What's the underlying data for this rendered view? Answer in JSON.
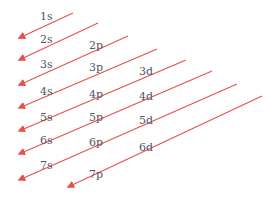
{
  "colors": {
    "arrow": "#e8504a",
    "label": "#555566",
    "background": "#ffffff"
  },
  "orbitals": [
    {
      "label": "1s",
      "x": 40,
      "y": 17
    },
    {
      "label": "2s",
      "x": 40,
      "y": 40
    },
    {
      "label": "2p",
      "x": 89,
      "y": 46
    },
    {
      "label": "3s",
      "x": 40,
      "y": 65
    },
    {
      "label": "3p",
      "x": 89,
      "y": 68
    },
    {
      "label": "3d",
      "x": 139,
      "y": 72
    },
    {
      "label": "4s",
      "x": 40,
      "y": 92
    },
    {
      "label": "4p",
      "x": 89,
      "y": 95
    },
    {
      "label": "4d",
      "x": 139,
      "y": 97
    },
    {
      "label": "5s",
      "x": 40,
      "y": 118
    },
    {
      "label": "5p",
      "x": 89,
      "y": 118
    },
    {
      "label": "5d",
      "x": 139,
      "y": 121
    },
    {
      "label": "6s",
      "x": 40,
      "y": 141
    },
    {
      "label": "6p",
      "x": 89,
      "y": 143
    },
    {
      "label": "6d",
      "x": 139,
      "y": 148
    },
    {
      "label": "7s",
      "x": 40,
      "y": 166
    },
    {
      "label": "7p",
      "x": 89,
      "y": 175
    }
  ],
  "arrows": [
    {
      "x1": 73,
      "y1": 13,
      "x2": 19,
      "y2": 38
    },
    {
      "x1": 98,
      "y1": 23,
      "x2": 19,
      "y2": 60
    },
    {
      "x1": 128,
      "y1": 36,
      "x2": 19,
      "y2": 85
    },
    {
      "x1": 157,
      "y1": 49,
      "x2": 19,
      "y2": 108
    },
    {
      "x1": 186,
      "y1": 60,
      "x2": 19,
      "y2": 131
    },
    {
      "x1": 212,
      "y1": 71,
      "x2": 19,
      "y2": 154
    },
    {
      "x1": 237,
      "y1": 84,
      "x2": 19,
      "y2": 180
    },
    {
      "x1": 262,
      "y1": 96,
      "x2": 68,
      "y2": 187
    }
  ]
}
